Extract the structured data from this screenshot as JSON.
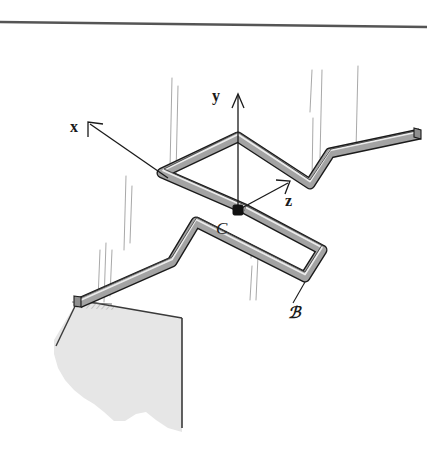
{
  "figure": {
    "kind": "engineering-mechanics-diagram",
    "background_color": "#ffffff",
    "rule_color": "#555555",
    "rod": {
      "fill_color": "#a0a0a0",
      "outline_color": "#1a1a1a",
      "highlight_color": "#d8d8d8"
    },
    "wall": {
      "face_color": "#e2e2e2",
      "edge_color": "#3a3a3a"
    },
    "projection_line_color": "#a8a8a8"
  },
  "labels": {
    "axis_x": "x",
    "axis_y": "y",
    "axis_z": "z",
    "point_c": "C",
    "body_b": "ℬ"
  }
}
